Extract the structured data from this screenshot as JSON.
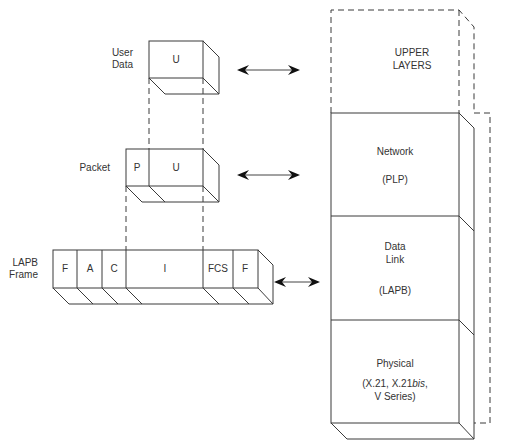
{
  "labels": {
    "user_data": [
      "User",
      "Data"
    ],
    "packet": "Packet",
    "lapb_frame": [
      "LAPB",
      "Frame"
    ]
  },
  "user_data_box": {
    "fields": [
      "U"
    ]
  },
  "packet_box": {
    "fields": [
      "P",
      "U"
    ]
  },
  "lapb_box": {
    "fields": [
      "F",
      "A",
      "C",
      "I",
      "FCS",
      "F"
    ]
  },
  "stack": {
    "upper": [
      "UPPER",
      "LAYERS"
    ],
    "network": {
      "name": "Network",
      "protocol": "(PLP)"
    },
    "data_link": {
      "name": [
        "Data",
        "Link"
      ],
      "protocol": "(LAPB)"
    },
    "physical": {
      "name": "Physical",
      "protocol_line1_prefix": "(X.21, X.21",
      "protocol_line1_italic": "bis",
      "protocol_line1_suffix": ",",
      "protocol_line2": "V Series)"
    }
  }
}
